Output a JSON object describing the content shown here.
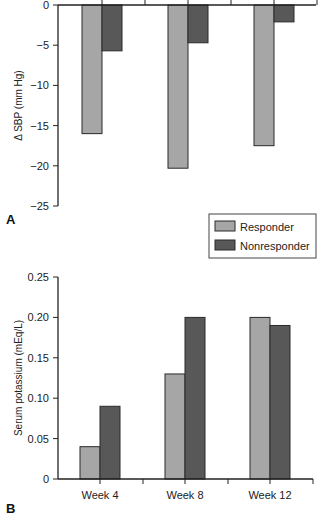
{
  "colors": {
    "responder": "#a6a6a6",
    "nonresponder": "#585858",
    "axis": "#222222",
    "bar_edge": "#2a2a2a"
  },
  "legend": {
    "items": [
      {
        "label": "Responder",
        "series": "responder"
      },
      {
        "label": "Nonresponder",
        "series": "nonresponder"
      }
    ]
  },
  "chart_data": [
    {
      "panel": "A",
      "type": "bar",
      "title": "",
      "xlabel": "",
      "ylabel": "Δ SBP (mm Hg)",
      "categories": [
        "Week 4",
        "Week 8",
        "Week 12"
      ],
      "series": [
        {
          "name": "Responder",
          "values": [
            -16.0,
            -20.3,
            -17.5
          ]
        },
        {
          "name": "Nonresponder",
          "values": [
            -5.7,
            -4.7,
            -2.1
          ]
        }
      ],
      "ylim": [
        -25,
        0
      ],
      "yticks": [
        0,
        -5,
        -10,
        -15,
        -20,
        -25
      ],
      "ytick_labels": [
        "0",
        "−5",
        "−10",
        "−15",
        "−20",
        "−25"
      ],
      "x_axis_position": "top",
      "grid": false,
      "legend_position": "below panel, right"
    },
    {
      "panel": "B",
      "type": "bar",
      "title": "",
      "xlabel": "",
      "ylabel": "Serum potassium (mEq/L)",
      "categories": [
        "Week 4",
        "Week 8",
        "Week 12"
      ],
      "series": [
        {
          "name": "Responder",
          "values": [
            0.04,
            0.13,
            0.2
          ]
        },
        {
          "name": "Nonresponder",
          "values": [
            0.09,
            0.2,
            0.19
          ]
        }
      ],
      "ylim": [
        0,
        0.25
      ],
      "yticks": [
        0,
        0.05,
        0.1,
        0.15,
        0.2,
        0.25
      ],
      "ytick_labels": [
        "0",
        "0.05",
        "0.10",
        "0.15",
        "0.20",
        "0.25"
      ],
      "x_axis_position": "bottom",
      "grid": false,
      "legend_position": "above panel, right"
    }
  ]
}
